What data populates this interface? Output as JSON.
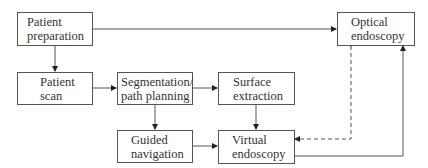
{
  "diagram": {
    "nodes": {
      "patient_preparation": {
        "line1": "Patient",
        "line2": "preparation"
      },
      "patient_scan": {
        "line1": "Patient",
        "line2": "scan"
      },
      "segmentation": {
        "line1": "Segmentation/",
        "line2": "path planning"
      },
      "surface_extraction": {
        "line1": "Surface",
        "line2": "extraction"
      },
      "optical_endoscopy": {
        "line1": "Optical",
        "line2": "endoscopy"
      },
      "guided_navigation": {
        "line1": "Guided",
        "line2": "navigation"
      },
      "virtual_endoscopy": {
        "line1": "Virtual",
        "line2": "endoscopy"
      }
    },
    "edges": [
      {
        "from": "Patient preparation",
        "to": "Optical endoscopy",
        "style": "solid"
      },
      {
        "from": "Patient preparation",
        "to": "Patient scan",
        "style": "solid"
      },
      {
        "from": "Patient scan",
        "to": "Segmentation/path planning",
        "style": "solid"
      },
      {
        "from": "Segmentation/path planning",
        "to": "Surface extraction",
        "style": "solid"
      },
      {
        "from": "Segmentation/path planning",
        "to": "Guided navigation",
        "style": "solid"
      },
      {
        "from": "Surface extraction",
        "to": "Virtual endoscopy",
        "style": "solid"
      },
      {
        "from": "Guided navigation",
        "to": "Virtual endoscopy",
        "style": "solid"
      },
      {
        "from": "Virtual endoscopy",
        "to": "Optical endoscopy",
        "style": "solid"
      },
      {
        "from": "Optical endoscopy",
        "to": "Virtual endoscopy",
        "style": "dashed"
      }
    ],
    "colors": {
      "line": "#444444",
      "text": "#333333",
      "border": "#555555"
    }
  }
}
